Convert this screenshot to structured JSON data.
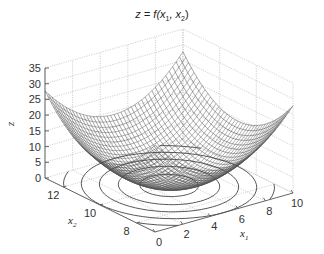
{
  "chart_data": {
    "type": "surface3d",
    "title": "z = f(x1, x2)",
    "title_parts": {
      "pre": "z = f(x",
      "sub1": "1",
      "mid": ", x",
      "sub2": "2",
      "post": ")"
    },
    "xlabel": "x1",
    "ylabel": "x2",
    "zlabel": "z",
    "x1_ticks": [
      "0",
      "2",
      "4",
      "6",
      "8",
      "10"
    ],
    "x2_ticks": [
      "8",
      "10",
      "12"
    ],
    "z_ticks": [
      "0",
      "5",
      "10",
      "15",
      "20",
      "25",
      "30",
      "35"
    ],
    "x1_range": [
      0,
      10
    ],
    "x2_range": [
      7,
      13
    ],
    "z_range": [
      0,
      35
    ],
    "grid": true,
    "surface": "paraboloid bowl, minimum near (5, 10) at z≈0, corners reach ≈30",
    "contours": "concentric elliptical contours projected on z=0 plane",
    "colors": {
      "surface_line": "#333333",
      "grid": "#bbbbbb",
      "axis": "#444444"
    }
  }
}
